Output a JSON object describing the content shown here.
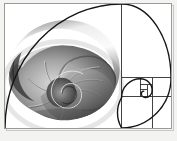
{
  "figure": {
    "title": "Golden spiral over nautilus shell",
    "overlay": "golden-rectangle-subdivision-with-logarithmic-spiral",
    "background_color": "#ffffff",
    "line_color": "#1a1a1a",
    "grid_color": "#2b2b2b",
    "frame_color": "#9a9a98",
    "shell_tone_light": "#f2f2f2",
    "shell_tone_mid": "#8c8c8c",
    "shell_tone_dark": "#2e2e2e",
    "width_px": 177,
    "height_px": 141
  },
  "chart_data": {
    "type": "line",
    "title": "Golden spiral over nautilus shell",
    "subtitle": "",
    "xlabel": "",
    "ylabel": "",
    "grid": true,
    "legend_position": "none",
    "xlim": [
      0,
      168
    ],
    "ylim": [
      0,
      126
    ],
    "ratio": 1.618,
    "subdivisions": [
      {
        "index": 1,
        "label": "A",
        "x": 0,
        "y": 0,
        "w": 118,
        "h": 126,
        "orientation": "square",
        "note": "largest square, left portion of plate"
      },
      {
        "index": 2,
        "label": "B",
        "x": 118,
        "y": 0,
        "w": 50,
        "h": 75,
        "orientation": "square",
        "note": "upper right square"
      },
      {
        "index": 3,
        "label": "C",
        "x": 118,
        "y": 75,
        "w": 50,
        "h": 51,
        "orientation": "square",
        "note": "lower right square"
      },
      {
        "index": 4,
        "label": "D",
        "x": 118,
        "y": 75,
        "w": 31,
        "h": 31,
        "orientation": "square"
      },
      {
        "index": 5,
        "label": "E",
        "x": 149,
        "y": 75,
        "w": 19,
        "h": 19,
        "orientation": "square"
      },
      {
        "index": 6,
        "label": "F",
        "x": 137,
        "y": 82,
        "w": 12,
        "h": 12,
        "orientation": "square"
      },
      {
        "index": 7,
        "label": "G",
        "x": 137,
        "y": 82,
        "w": 7,
        "h": 7,
        "orientation": "square"
      }
    ],
    "grid_lines": [
      {
        "orientation": "vertical",
        "x": 118,
        "y0": 0,
        "y1": 126
      },
      {
        "orientation": "horizontal",
        "x0": 118,
        "x1": 168,
        "y": 75
      },
      {
        "orientation": "vertical",
        "x": 149,
        "y0": 75,
        "y1": 126
      },
      {
        "orientation": "horizontal",
        "x0": 118,
        "x1": 168,
        "y": 94
      },
      {
        "orientation": "vertical",
        "x": 137,
        "y0": 75,
        "y1": 94
      },
      {
        "orientation": "horizontal",
        "x0": 137,
        "x1": 149,
        "y": 82
      }
    ],
    "spiral": {
      "name": "golden-spiral",
      "turns": 3.2,
      "center_x": 143,
      "center_y": 88,
      "start_x": 0,
      "start_y": 126,
      "stroke_width": 1.4,
      "color": "#141414"
    },
    "shell": {
      "name": "nautilus-shell",
      "spiral_center_x": 56,
      "spiral_center_y": 90,
      "chamber_count": 9,
      "palette": [
        "#ffffff",
        "#d9d9d9",
        "#a8a8a8",
        "#6e6e6e",
        "#3a3a3a",
        "#1c1c1c"
      ]
    }
  }
}
